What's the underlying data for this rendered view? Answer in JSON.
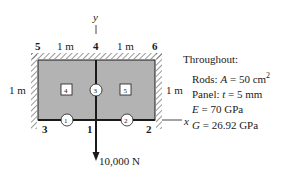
{
  "axes": {
    "y_label": "y",
    "x_label": "x"
  },
  "nodes": [
    {
      "id": "5",
      "label": "5"
    },
    {
      "id": "4",
      "label": "4"
    },
    {
      "id": "6",
      "label": "6"
    },
    {
      "id": "3",
      "label": "3"
    },
    {
      "id": "1",
      "label": "1"
    },
    {
      "id": "2",
      "label": "2"
    }
  ],
  "elements": {
    "rods": [
      {
        "id": "1",
        "label": "1"
      },
      {
        "id": "2",
        "label": "2"
      },
      {
        "id": "3",
        "label": "3"
      }
    ],
    "panels": [
      {
        "id": "4",
        "label": "4"
      },
      {
        "id": "5",
        "label": "5"
      }
    ]
  },
  "dimensions": {
    "top_left": "1 m",
    "top_right": "1 m",
    "left_height": "1 m",
    "right_height": "1 m"
  },
  "load": {
    "label": "10,000 N"
  },
  "properties": {
    "heading": "Throughout:",
    "rods_prefix": "Rods: ",
    "rods_var": "A",
    "rods_value": " = 50 cm",
    "rods_exp": "2",
    "panel_prefix": "Panel: ",
    "panel_var": "t",
    "panel_value": " = 5 mm",
    "e_var": "E",
    "e_value": " = 70 GPa",
    "g_var": "G",
    "g_value": " = 26.92 GPa"
  },
  "colors": {
    "panel_fill": "#b3b3b3",
    "line": "#1a1a1a",
    "hatch": "#555555"
  }
}
